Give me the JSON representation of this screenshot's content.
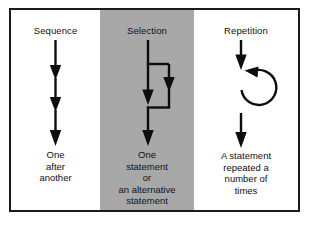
{
  "figure": {
    "border_color": "#1b1b1b",
    "band_color": "#a8a8a8",
    "ink_color": "#0d0d0d",
    "background_color": "#ffffff"
  },
  "panels": [
    {
      "id": "sequence",
      "title": "Sequence",
      "icon": "three-down-arrows-icon",
      "caption_lines": [
        "One",
        "after",
        "another"
      ],
      "shaded": false
    },
    {
      "id": "selection",
      "title": "Selection",
      "icon": "branch-arrows-icon",
      "caption_lines": [
        "One",
        "statement",
        "or",
        "an alternative",
        "statement"
      ],
      "shaded": true
    },
    {
      "id": "repetition",
      "title": "Repetition",
      "icon": "loop-arrow-icon",
      "caption_lines": [
        "A statement",
        "repeated a",
        "number of",
        "times"
      ],
      "shaded": false
    }
  ]
}
